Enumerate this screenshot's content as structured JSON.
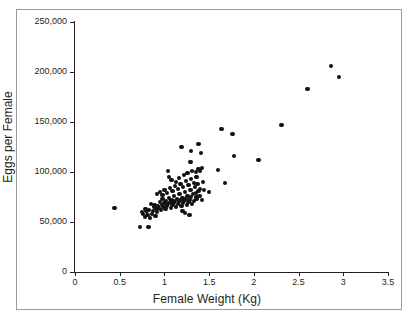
{
  "chart_data": {
    "type": "scatter",
    "title": "",
    "xlabel": "Female Weight (Kg)",
    "ylabel": "Eggs per Female",
    "xlim": [
      0,
      3.5
    ],
    "ylim": [
      0,
      250000
    ],
    "xticks": [
      "0",
      "0.5",
      "1",
      "1.5",
      "2",
      "2.5",
      "3",
      "3.5"
    ],
    "xtick_values": [
      0,
      0.5,
      1,
      1.5,
      2,
      2.5,
      3,
      3.5
    ],
    "yticks": [
      "0",
      "50,000",
      "100,000",
      "150,000",
      "200,000",
      "250,000"
    ],
    "ytick_values": [
      0,
      50000,
      100000,
      150000,
      200000,
      250000
    ],
    "grid": false,
    "legend": null,
    "marker": "filled-circle",
    "marker_color": "#111111",
    "n_points": 118,
    "points": [
      [
        0.44,
        64000
      ],
      [
        0.73,
        45000
      ],
      [
        0.82,
        45000
      ],
      [
        0.76,
        58000
      ],
      [
        0.78,
        55000
      ],
      [
        0.8,
        61000
      ],
      [
        0.81,
        57000
      ],
      [
        0.79,
        63000
      ],
      [
        0.75,
        60000
      ],
      [
        0.84,
        54000
      ],
      [
        0.86,
        58000
      ],
      [
        0.83,
        62000
      ],
      [
        0.88,
        65000
      ],
      [
        0.85,
        68000
      ],
      [
        0.87,
        61000
      ],
      [
        0.9,
        56000
      ],
      [
        0.91,
        63000
      ],
      [
        0.89,
        67000
      ],
      [
        0.92,
        60000
      ],
      [
        0.93,
        66000
      ],
      [
        0.94,
        64000
      ],
      [
        0.95,
        70000
      ],
      [
        0.96,
        62000
      ],
      [
        0.97,
        67000
      ],
      [
        0.98,
        73000
      ],
      [
        0.99,
        65000
      ],
      [
        1.0,
        69000
      ],
      [
        1.01,
        63000
      ],
      [
        1.02,
        71000
      ],
      [
        1.03,
        66000
      ],
      [
        1.04,
        68000
      ],
      [
        1.05,
        74000
      ],
      [
        1.06,
        70000
      ],
      [
        1.07,
        64000
      ],
      [
        1.08,
        72000
      ],
      [
        1.09,
        67000
      ],
      [
        1.1,
        69000
      ],
      [
        1.11,
        76000
      ],
      [
        1.12,
        71000
      ],
      [
        1.13,
        65000
      ],
      [
        1.14,
        73000
      ],
      [
        1.15,
        68000
      ],
      [
        1.16,
        70000
      ],
      [
        1.17,
        78000
      ],
      [
        1.18,
        72000
      ],
      [
        1.19,
        66000
      ],
      [
        1.2,
        74000
      ],
      [
        1.21,
        69000
      ],
      [
        1.22,
        71000
      ],
      [
        1.23,
        80000
      ],
      [
        1.24,
        73000
      ],
      [
        1.25,
        67000
      ],
      [
        1.26,
        76000
      ],
      [
        1.27,
        70000
      ],
      [
        1.28,
        72000
      ],
      [
        1.29,
        82000
      ],
      [
        1.3,
        75000
      ],
      [
        1.31,
        68000
      ],
      [
        1.32,
        78000
      ],
      [
        1.33,
        71000
      ],
      [
        1.34,
        85000
      ],
      [
        1.35,
        79000
      ],
      [
        1.36,
        73000
      ],
      [
        1.37,
        88000
      ],
      [
        1.38,
        81000
      ],
      [
        1.39,
        76000
      ],
      [
        1.4,
        83000
      ],
      [
        1.42,
        72000
      ],
      [
        1.43,
        90000
      ],
      [
        0.92,
        78000
      ],
      [
        0.95,
        80000
      ],
      [
        0.98,
        77000
      ],
      [
        1.0,
        82000
      ],
      [
        1.03,
        79000
      ],
      [
        1.06,
        84000
      ],
      [
        1.09,
        81000
      ],
      [
        1.12,
        86000
      ],
      [
        1.15,
        83000
      ],
      [
        1.18,
        88000
      ],
      [
        1.21,
        85000
      ],
      [
        1.24,
        91000
      ],
      [
        1.27,
        87000
      ],
      [
        1.3,
        93000
      ],
      [
        1.33,
        89000
      ],
      [
        1.36,
        95000
      ],
      [
        1.05,
        95000
      ],
      [
        1.08,
        92000
      ],
      [
        1.13,
        90000
      ],
      [
        1.16,
        94000
      ],
      [
        1.22,
        97000
      ],
      [
        1.26,
        99000
      ],
      [
        1.31,
        101000
      ],
      [
        1.35,
        100000
      ],
      [
        1.38,
        103000
      ],
      [
        1.4,
        101000
      ],
      [
        1.42,
        104000
      ],
      [
        1.04,
        101000
      ],
      [
        1.19,
        125000
      ],
      [
        1.3,
        121000
      ],
      [
        1.38,
        128000
      ],
      [
        1.41,
        119000
      ],
      [
        1.29,
        110000
      ],
      [
        1.44,
        82000
      ],
      [
        1.28,
        57000
      ],
      [
        1.36,
        75000
      ],
      [
        1.2,
        61000
      ],
      [
        1.23,
        59000
      ],
      [
        1.5,
        80000
      ],
      [
        1.6,
        102000
      ],
      [
        1.64,
        143000
      ],
      [
        1.76,
        138000
      ],
      [
        1.78,
        116000
      ],
      [
        1.68,
        89000
      ],
      [
        2.05,
        112000
      ],
      [
        2.31,
        147000
      ],
      [
        2.6,
        183000
      ],
      [
        2.86,
        206000
      ],
      [
        2.95,
        195000
      ]
    ]
  },
  "axis": {
    "x_title": "Female Weight (Kg)",
    "y_title": "Eggs per Female"
  }
}
